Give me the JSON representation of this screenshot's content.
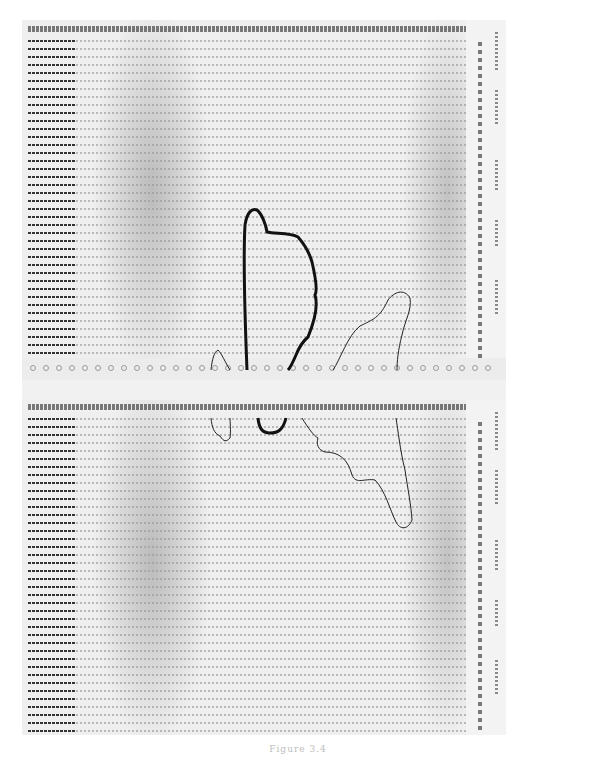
{
  "figure": {
    "type": "scanned line-printer output with hand-drawn contour lines",
    "panels": [
      {
        "id": "upper",
        "description": "character-density printout, top sheet"
      },
      {
        "id": "lower",
        "description": "character-density printout, bottom sheet"
      }
    ],
    "contours": [
      {
        "id": "bold-contour-upper",
        "weight": "heavy"
      },
      {
        "id": "thin-contour-upper-left",
        "weight": "light"
      },
      {
        "id": "thin-contour-upper-right",
        "weight": "light"
      },
      {
        "id": "bold-contour-lower",
        "weight": "heavy"
      },
      {
        "id": "thin-contour-lower-left",
        "weight": "light"
      },
      {
        "id": "thin-contour-lower-right",
        "weight": "light"
      }
    ],
    "caption": "Figure 3.4",
    "colors": {
      "paper": "#efefef",
      "ink": "#333333",
      "contour": "#111111"
    }
  }
}
